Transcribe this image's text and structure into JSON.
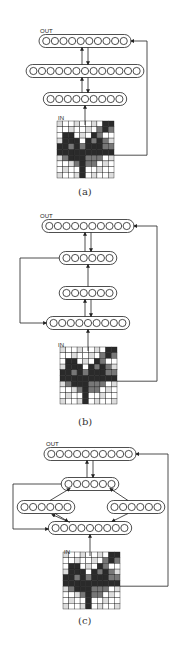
{
  "labels": {
    "out": "OUT",
    "in": "IN"
  },
  "panels": [
    {
      "caption": "(a)"
    },
    {
      "caption": "(b)"
    },
    {
      "caption": "(c)"
    }
  ],
  "colors": {
    "stroke": "#222222",
    "cell_dark": "#2a2a2a",
    "cell_mid": "#777777",
    "cell_light": "#bbbbbb"
  }
}
